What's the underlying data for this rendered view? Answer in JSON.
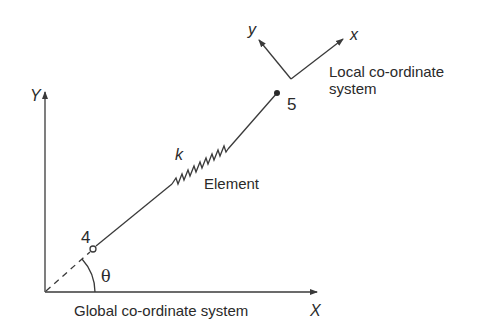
{
  "diagram": {
    "global_axes": {
      "x_label": "X",
      "y_label": "Y",
      "caption": "Global co-ordinate system"
    },
    "local_axes": {
      "x_label": "x",
      "y_label": "y",
      "caption_line1": "Local co-ordinate",
      "caption_line2": "system"
    },
    "element": {
      "label": "Element",
      "spring_label": "k",
      "node_start": "4",
      "node_end": "5",
      "angle_label": "θ"
    },
    "colors": {
      "line": "#3a3a3a",
      "text": "#2a2a2a",
      "background": "#ffffff"
    }
  }
}
